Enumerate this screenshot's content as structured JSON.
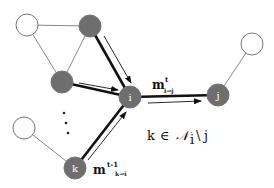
{
  "diagram": {
    "colors": {
      "active_node": "#6e6e6e",
      "inactive_node": "#ffffff",
      "edge": "#777777",
      "message_edge": "#111111",
      "label": "#ffffff"
    },
    "nodes": {
      "i": {
        "label": "i"
      },
      "j": {
        "label": "j"
      },
      "k": {
        "label": "k"
      }
    },
    "messages": {
      "i_to_j": {
        "base": "m",
        "sup": "t",
        "sub": "i→j"
      },
      "k_to_i": {
        "base": "m",
        "sup": "t-1",
        "sub": "k→i"
      }
    },
    "ellipsis": "⋮",
    "set_condition": {
      "var": "k",
      "in": "∈",
      "set": "𝒩",
      "set_sub": "i",
      "minus": "\\",
      "excluded": "j"
    }
  }
}
